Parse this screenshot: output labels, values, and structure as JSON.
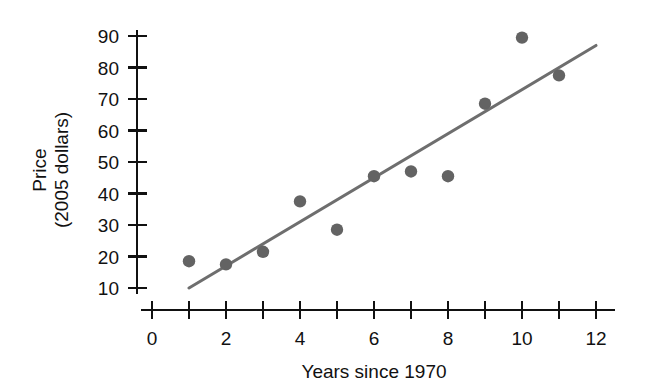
{
  "chart_data": {
    "type": "scatter",
    "title": "",
    "xlabel": "Years since 1970",
    "ylabel": "Price\n(2005 dollars)",
    "ylabel_line1": "Price",
    "ylabel_line2": "(2005 dollars)",
    "xlim": [
      0,
      12
    ],
    "ylim": [
      10,
      90
    ],
    "xticks": [
      0,
      1,
      2,
      3,
      4,
      5,
      6,
      7,
      8,
      9,
      10,
      11,
      12
    ],
    "xtick_labels": [
      "0",
      "",
      "2",
      "",
      "4",
      "",
      "6",
      "",
      "8",
      "",
      "10",
      "",
      "12"
    ],
    "yticks": [
      10,
      20,
      30,
      40,
      50,
      60,
      70,
      80,
      90
    ],
    "ytick_labels": [
      "10",
      "20",
      "30",
      "40",
      "50",
      "60",
      "70",
      "80",
      "90"
    ],
    "grid": false,
    "legend": false,
    "x": [
      1,
      2,
      3,
      4,
      5,
      6,
      7,
      8,
      9,
      10,
      11
    ],
    "y": [
      18.5,
      17.5,
      21.5,
      37.5,
      28.5,
      45.5,
      47,
      45.5,
      68.5,
      89.5,
      77.5
    ],
    "points": [
      {
        "x": 1,
        "y": 18.5
      },
      {
        "x": 2,
        "y": 17.5
      },
      {
        "x": 3,
        "y": 21.5
      },
      {
        "x": 4,
        "y": 37.5
      },
      {
        "x": 5,
        "y": 28.5
      },
      {
        "x": 6,
        "y": 45.5
      },
      {
        "x": 7,
        "y": 47
      },
      {
        "x": 8,
        "y": 45.5
      },
      {
        "x": 9,
        "y": 68.5
      },
      {
        "x": 10,
        "y": 89.5
      },
      {
        "x": 11,
        "y": 77.5
      }
    ],
    "trend_line": {
      "x0": 1,
      "y0": 10,
      "x1": 12,
      "y1": 87
    },
    "marker_color": "#636363",
    "line_color": "#6e6e6e",
    "axis_color": "#111111",
    "background_color": "#ffffff"
  }
}
